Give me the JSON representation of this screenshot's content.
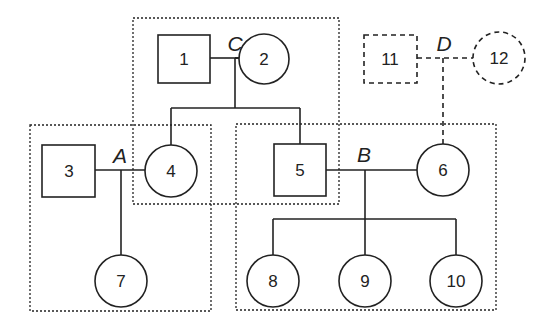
{
  "diagram": {
    "type": "pedigree",
    "groups": [
      {
        "id": "C",
        "x": 133,
        "y": 18,
        "w": 206,
        "h": 186
      },
      {
        "id": "A",
        "x": 30,
        "y": 125,
        "w": 181,
        "h": 186
      },
      {
        "id": "B",
        "x": 236,
        "y": 124,
        "w": 260,
        "h": 186
      }
    ],
    "nodes": [
      {
        "id": "1",
        "label": "1",
        "shape": "square",
        "style": "solid",
        "cx": 184,
        "cy": 59
      },
      {
        "id": "2",
        "label": "2",
        "shape": "circle",
        "style": "solid",
        "cx": 264,
        "cy": 59
      },
      {
        "id": "3",
        "label": "3",
        "shape": "square",
        "style": "solid",
        "cx": 68,
        "cy": 171
      },
      {
        "id": "4",
        "label": "4",
        "shape": "circle",
        "style": "solid",
        "cx": 171,
        "cy": 171
      },
      {
        "id": "5",
        "label": "5",
        "shape": "square",
        "style": "solid",
        "cx": 300,
        "cy": 170
      },
      {
        "id": "6",
        "label": "6",
        "shape": "circle",
        "style": "solid",
        "cx": 443,
        "cy": 170
      },
      {
        "id": "7",
        "label": "7",
        "shape": "circle",
        "style": "solid",
        "cx": 121,
        "cy": 281
      },
      {
        "id": "8",
        "label": "8",
        "shape": "circle",
        "style": "solid",
        "cx": 273,
        "cy": 281
      },
      {
        "id": "9",
        "label": "9",
        "shape": "circle",
        "style": "solid",
        "cx": 365,
        "cy": 281
      },
      {
        "id": "10",
        "label": "10",
        "shape": "circle",
        "style": "solid",
        "cx": 456,
        "cy": 281
      },
      {
        "id": "11",
        "label": "11",
        "shape": "square",
        "style": "dashed",
        "cx": 390,
        "cy": 59
      },
      {
        "id": "12",
        "label": "12",
        "shape": "circle",
        "style": "dashed",
        "cx": 499,
        "cy": 58
      }
    ],
    "couples": [
      {
        "label": "C",
        "partners": [
          "1",
          "2"
        ],
        "children": [
          "4",
          "5"
        ]
      },
      {
        "label": "A",
        "partners": [
          "3",
          "4"
        ],
        "children": [
          "7"
        ]
      },
      {
        "label": "B",
        "partners": [
          "5",
          "6"
        ],
        "children": [
          "8",
          "9",
          "10"
        ]
      },
      {
        "label": "D",
        "partners": [
          "11",
          "12"
        ],
        "children": [
          "6"
        ],
        "style": "dashed"
      }
    ]
  }
}
